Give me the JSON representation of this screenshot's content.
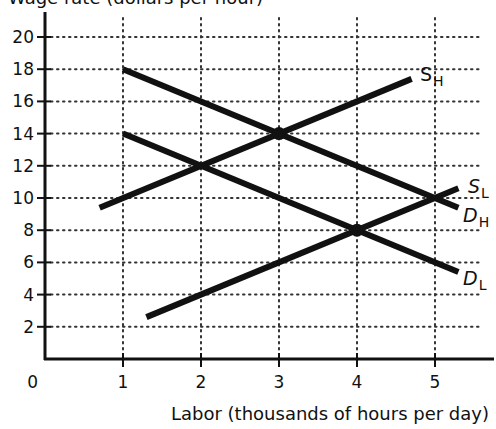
{
  "chart_data": {
    "type": "line",
    "title": "Wage rate (dollars per hour)",
    "title_clipped": true,
    "xlabel": "Labor (thousands of hours per day)",
    "ylabel": "",
    "xlim": [
      0,
      5.6
    ],
    "ylim": [
      0,
      21
    ],
    "x_ticks": [
      "0",
      "1",
      "2",
      "3",
      "4",
      "5"
    ],
    "y_ticks": [
      "2",
      "4",
      "6",
      "8",
      "10",
      "12",
      "14",
      "16",
      "18",
      "20"
    ],
    "grid": "dotted",
    "legend": "inline curve labels",
    "series": [
      {
        "name": "S_H",
        "label_main": "S",
        "label_sub": "H",
        "label_style": "normal",
        "x": [
          0.7,
          4.7
        ],
        "y": [
          9.4,
          17.4
        ]
      },
      {
        "name": "D_H",
        "label_main": "D",
        "label_sub": "H",
        "label_style": "italic",
        "x": [
          1.0,
          5.3
        ],
        "y": [
          18.0,
          9.4
        ]
      },
      {
        "name": "S_L",
        "label_main": "S",
        "label_sub": "L",
        "label_style": "italic",
        "x": [
          1.3,
          5.3
        ],
        "y": [
          2.6,
          10.6
        ]
      },
      {
        "name": "D_L",
        "label_main": "D",
        "label_sub": "L",
        "label_style": "italic",
        "x": [
          1.0,
          5.3
        ],
        "y": [
          14.0,
          5.4
        ]
      }
    ],
    "equilibrium_points": [
      {
        "x": 3,
        "y": 14
      },
      {
        "x": 4,
        "y": 8
      }
    ]
  },
  "labels": {
    "title": "Wage rate (dollars per hour)",
    "x_axis": "Labor (thousands of hours per day)",
    "origin": "0",
    "x_ticks": [
      "1",
      "2",
      "3",
      "4",
      "5"
    ],
    "y_ticks": [
      "2",
      "4",
      "6",
      "8",
      "10",
      "12",
      "14",
      "16",
      "18",
      "20"
    ],
    "s_h": {
      "main": "S",
      "sub": "H"
    },
    "d_h": {
      "main": "D",
      "sub": "H"
    },
    "s_l": {
      "main": "S",
      "sub": "L"
    },
    "d_l": {
      "main": "D",
      "sub": "L"
    }
  },
  "colors": {
    "line": "#111111",
    "grid": "#333333",
    "background": "#ffffff"
  }
}
